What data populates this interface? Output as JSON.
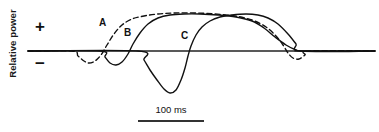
{
  "figure": {
    "y_axis_label": "Relative power",
    "positive_symbol": "+",
    "negative_symbol": "−",
    "scale_bar_label": "100 ms",
    "curve_labels": {
      "a": "A",
      "b": "B",
      "c": "C"
    },
    "colors": {
      "baseline": "#222222",
      "curve": "#111111",
      "background": "#ffffff",
      "text": "#111111"
    }
  },
  "chart_data": {
    "type": "line",
    "title": "",
    "subtitle": "",
    "xlabel": "",
    "ylabel": "Relative power",
    "xlim": [
      0,
      379
    ],
    "ylim": [
      -50,
      45
    ],
    "grid": false,
    "legend": "inline-labels",
    "baseline_y": 51,
    "annotations": [
      {
        "text": "+",
        "meaning": "positive relative power",
        "x": 35,
        "y": 26
      },
      {
        "text": "−",
        "meaning": "negative relative power",
        "x": 35,
        "y": 60
      },
      {
        "text": "A",
        "x": 103,
        "y": 24
      },
      {
        "text": "B",
        "x": 128,
        "y": 34
      },
      {
        "text": "C",
        "x": 185,
        "y": 37
      },
      {
        "text": "100 ms",
        "x": 171,
        "y": 110,
        "role": "scale-bar-label"
      }
    ],
    "scale_bar": {
      "label": "100 ms",
      "x_start": 138,
      "x_end": 204,
      "y": 120,
      "span_ms": 100
    },
    "series": [
      {
        "name": "A",
        "style": "dashed",
        "description": "Dashed waveform: small early negative deflection then broad sustained positive plateau returning through a shallow late negative dip to baseline",
        "points": [
          [
            28,
            51
          ],
          [
            72,
            51
          ],
          [
            78,
            56
          ],
          [
            84,
            61
          ],
          [
            89,
            63
          ],
          [
            95,
            61
          ],
          [
            101,
            55
          ],
          [
            107,
            45
          ],
          [
            114,
            34
          ],
          [
            122,
            25
          ],
          [
            132,
            19
          ],
          [
            144,
            16
          ],
          [
            158,
            14
          ],
          [
            175,
            13
          ],
          [
            195,
            13
          ],
          [
            215,
            14
          ],
          [
            235,
            16
          ],
          [
            252,
            20
          ],
          [
            266,
            27
          ],
          [
            276,
            36
          ],
          [
            283,
            45
          ],
          [
            288,
            53
          ],
          [
            293,
            58
          ],
          [
            299,
            59
          ],
          [
            305,
            55
          ],
          [
            309,
            51
          ],
          [
            375,
            51
          ]
        ]
      },
      {
        "name": "B",
        "style": "solid",
        "description": "Solid waveform: moderate early negative trough then rapid rise to a broad positive plateau, decaying to baseline at the right",
        "points": [
          [
            28,
            51
          ],
          [
            100,
            51
          ],
          [
            105,
            57
          ],
          [
            110,
            63
          ],
          [
            116,
            65
          ],
          [
            122,
            62
          ],
          [
            128,
            54
          ],
          [
            133,
            44
          ],
          [
            140,
            33
          ],
          [
            148,
            24
          ],
          [
            158,
            18
          ],
          [
            170,
            15
          ],
          [
            184,
            14
          ],
          [
            200,
            14
          ],
          [
            218,
            15
          ],
          [
            236,
            17
          ],
          [
            252,
            21
          ],
          [
            264,
            28
          ],
          [
            275,
            37
          ],
          [
            286,
            45
          ],
          [
            296,
            50
          ],
          [
            302,
            51
          ],
          [
            375,
            51
          ]
        ]
      },
      {
        "name": "C",
        "style": "solid",
        "description": "Solid waveform: large deep negative trough peaking near -42 units, then steep rise to a late positive plateau returning to baseline",
        "points": [
          [
            28,
            51
          ],
          [
            138,
            51
          ],
          [
            144,
            60
          ],
          [
            150,
            70
          ],
          [
            157,
            80
          ],
          [
            164,
            89
          ],
          [
            170,
            93
          ],
          [
            176,
            90
          ],
          [
            181,
            80
          ],
          [
            185,
            68
          ],
          [
            188,
            56
          ],
          [
            191,
            46
          ],
          [
            196,
            35
          ],
          [
            202,
            27
          ],
          [
            210,
            21
          ],
          [
            220,
            17
          ],
          [
            232,
            15
          ],
          [
            246,
            14
          ],
          [
            258,
            15
          ],
          [
            268,
            18
          ],
          [
            278,
            24
          ],
          [
            288,
            34
          ],
          [
            296,
            44
          ],
          [
            301,
            51
          ],
          [
            375,
            51
          ]
        ]
      }
    ]
  }
}
